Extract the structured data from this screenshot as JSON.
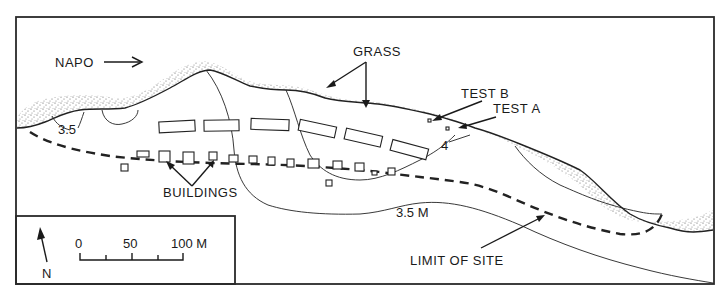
{
  "map": {
    "labels": {
      "river": "NAPO",
      "grass": "GRASS",
      "test_b": "TEST B",
      "test_a": "TEST A",
      "buildings": "BUILDINGS",
      "contour_left": "3.5",
      "contour_4": "4",
      "contour_main": "3.5 M",
      "limit": "LIMIT OF SITE"
    },
    "legend": {
      "north_label": "N",
      "scale_ticks": [
        "0",
        "50",
        "100 M"
      ]
    },
    "colors": {
      "ink": "#1a1a1a",
      "paper": "#ffffff",
      "stipple": "#555555"
    }
  }
}
